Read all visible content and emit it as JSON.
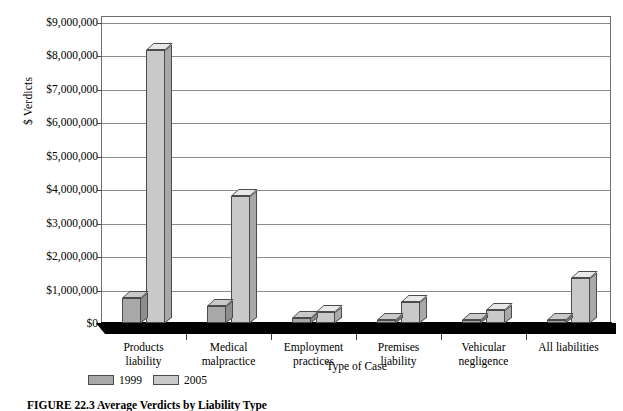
{
  "chart_data": {
    "type": "bar",
    "title": "",
    "categories": [
      "Products liability",
      "Medical malpractice",
      "Employment practices",
      "Premises liability",
      "Vehicular negligence",
      "All liabilities"
    ],
    "category_lines": [
      [
        "Products",
        "liability"
      ],
      [
        "Medical",
        "malpractice"
      ],
      [
        "Employment",
        "practices"
      ],
      [
        "Premises",
        "liability"
      ],
      [
        "Vehicular",
        "negligence"
      ],
      [
        "All liabilities"
      ]
    ],
    "series": [
      {
        "name": "1999",
        "color": "#a8a8a8",
        "values": [
          750000,
          500000,
          150000,
          90000,
          60000,
          100000
        ]
      },
      {
        "name": "2005",
        "color": "#c9c9c9",
        "values": [
          8150000,
          3800000,
          320000,
          620000,
          400000,
          1350000
        ]
      }
    ],
    "xlabel": "Type of Case",
    "ylabel": "$ Verdicts",
    "ylim": [
      0,
      9000000
    ],
    "ytick_values": [
      0,
      1000000,
      2000000,
      3000000,
      4000000,
      5000000,
      6000000,
      7000000,
      8000000,
      9000000
    ],
    "ytick_labels": [
      "$0",
      "$1,000,000",
      "$2,000,000",
      "$3,000,000",
      "$4,000,000",
      "$5,000,000",
      "$6,000,000",
      "$7,000,000",
      "$8,000,000",
      "$9,000,000"
    ],
    "grid": true,
    "legend_position": "bottom-left",
    "style": "3d-column"
  },
  "legend": {
    "items": [
      {
        "label": "1999"
      },
      {
        "label": "2005"
      }
    ]
  },
  "axis": {
    "y_title": "$ Verdicts",
    "x_title": "Type of Case"
  },
  "caption": {
    "text": "FIGURE 22.3  Average Verdicts by Liability Type"
  }
}
